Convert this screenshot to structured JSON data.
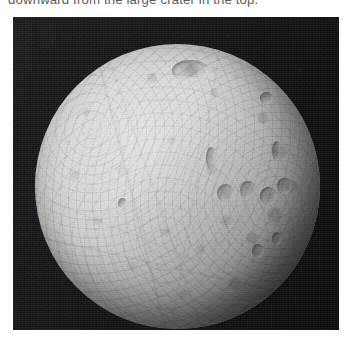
{
  "caption": {
    "clipped_line": "downward from the large crater in the top."
  },
  "figure": {
    "alt": "Grayscale spacecraft photograph of an icy, heavily cratered moon against black space",
    "features": {
      "large_top_crater": "large-crater-top",
      "right_limb_crater_row": "crater-row-right-limb",
      "ridges": "surface-ridges"
    },
    "colors": {
      "space": "#0e0e0e",
      "surface_bright": "#e3e3e1",
      "surface_mid": "#c2c2bf",
      "surface_shadow": "#4a4a48",
      "page_background": "#ffffff",
      "caption_text": "#5c5c5c"
    }
  }
}
